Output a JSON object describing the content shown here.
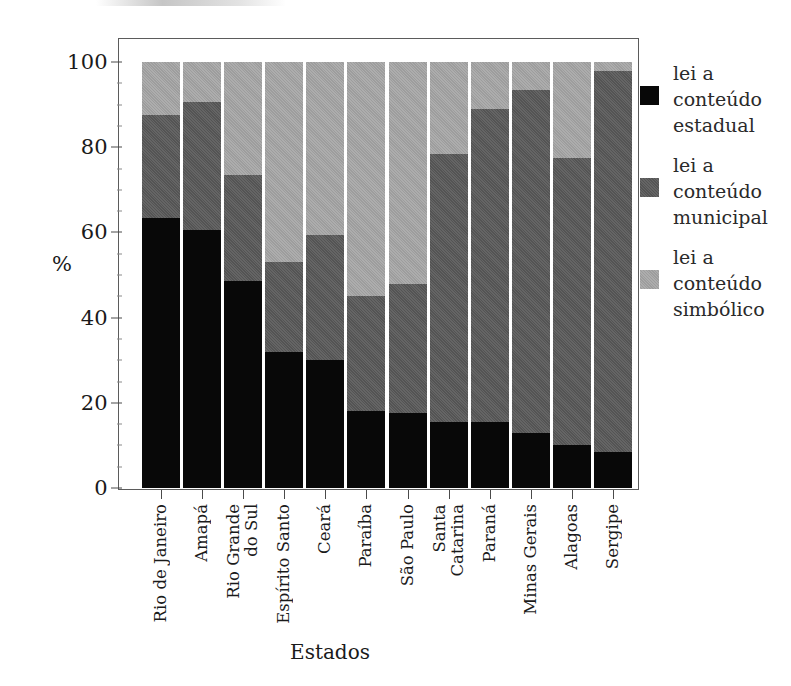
{
  "chart_data": {
    "type": "bar",
    "subtype": "stacked-bar-100",
    "title": "",
    "xlabel": "Estados",
    "ylabel": "%",
    "ylim": [
      0,
      100
    ],
    "yticks": [
      0,
      20,
      40,
      60,
      80,
      100
    ],
    "grid": false,
    "legend_position": "right",
    "categories": [
      "Rio de Janeiro",
      "Amapá",
      "Rio Grande do Sul",
      "Espírito Santo",
      "Ceará",
      "Paraíba",
      "São Paulo",
      "Santa Catarina",
      "Paraná",
      "Minas Gerais",
      "Alagoas",
      "Sergipe"
    ],
    "series": [
      {
        "name": "lei a conteúdo estadual",
        "color": "#080808",
        "values": [
          63.5,
          60.5,
          48.5,
          32.0,
          30.0,
          18.0,
          17.5,
          15.5,
          15.5,
          13.0,
          10.0,
          8.5
        ]
      },
      {
        "name": "lei a conteúdo municipal",
        "color": "#545454",
        "values": [
          24.0,
          30.0,
          25.0,
          21.0,
          29.5,
          27.0,
          30.5,
          63.0,
          73.5,
          80.5,
          67.5,
          89.5
        ]
      },
      {
        "name": "lei a conteúdo simbólico",
        "color": "#9d9d9d",
        "values": [
          12.5,
          9.5,
          26.5,
          47.0,
          40.5,
          55.0,
          52.0,
          21.5,
          11.0,
          6.5,
          22.5,
          2.0
        ]
      }
    ]
  },
  "axes": {
    "y_title": "%",
    "x_title": "Estados",
    "y_tick_labels": [
      "100",
      "80",
      "60",
      "40",
      "20",
      "0"
    ],
    "x_tick_labels": [
      {
        "line1": "Rio de Janeiro",
        "line2": ""
      },
      {
        "line1": "Amapá",
        "line2": ""
      },
      {
        "line1": "Rio Grande",
        "line2": "do Sul"
      },
      {
        "line1": "Espírito Santo",
        "line2": ""
      },
      {
        "line1": "Ceará",
        "line2": ""
      },
      {
        "line1": "Paraíba",
        "line2": ""
      },
      {
        "line1": "São Paulo",
        "line2": ""
      },
      {
        "line1": "Santa",
        "line2": "Catarina"
      },
      {
        "line1": "Paraná",
        "line2": ""
      },
      {
        "line1": "Minas Gerais",
        "line2": ""
      },
      {
        "line1": "Alagoas",
        "line2": ""
      },
      {
        "line1": "Sergipe",
        "line2": ""
      }
    ]
  },
  "legend": {
    "items": [
      {
        "label_line1": "lei a",
        "label_line2": "conteúdo",
        "label_line3": "estadual",
        "swatch": "#080808",
        "swatch_name": "legend-swatch-estadual"
      },
      {
        "label_line1": "lei a",
        "label_line2": "conteúdo",
        "label_line3": "municipal",
        "swatch": "#545454",
        "swatch_name": "legend-swatch-municipal"
      },
      {
        "label_line1": "lei a",
        "label_line2": "conteúdo",
        "label_line3": "simbólico",
        "swatch": "#9d9d9d",
        "swatch_name": "legend-swatch-simbolico"
      }
    ]
  },
  "colors": {
    "estadual": "#080808",
    "municipal": "#545454",
    "simbolico": "#9d9d9d",
    "frame": "#5b5b5b",
    "background": "#ffffff",
    "text": "#1a1a1a"
  }
}
